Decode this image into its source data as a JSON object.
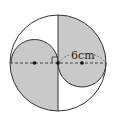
{
  "diagram": {
    "title": "",
    "measure_label": "6cm",
    "colors": {
      "shade": "#c9c9c9",
      "stroke": "#333333",
      "background": "#ffffff"
    },
    "big_circle": {
      "cx": 58,
      "cy": 63,
      "r": 48
    },
    "left_semicircle": {
      "cx": 34.5,
      "cy": 63,
      "r": 23.5,
      "side": "upper"
    },
    "right_semicircle": {
      "cx": 82,
      "cy": 63,
      "r": 24,
      "side": "lower"
    },
    "points": [
      {
        "name": "left-center",
        "x": 34.5,
        "y": 63
      },
      {
        "name": "big-center",
        "x": 58,
        "y": 63
      },
      {
        "name": "right-center",
        "x": 82,
        "y": 63
      }
    ],
    "right_angle_marker": true
  }
}
